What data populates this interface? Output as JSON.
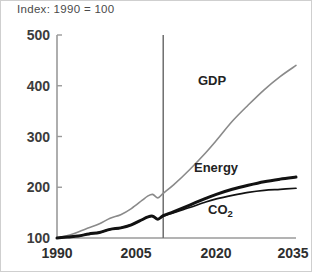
{
  "chart_data": {
    "type": "line",
    "title": "Index: 1990 = 100",
    "xlabel": "",
    "ylabel": "",
    "xlim": [
      1990,
      2035
    ],
    "ylim": [
      100,
      500
    ],
    "grid": false,
    "legend_position": "inline-annotations",
    "xticks": [
      "1990",
      "2005",
      "2020",
      "2035"
    ],
    "xtick_values": [
      1990,
      2005,
      2020,
      2035
    ],
    "yticks": [
      "100",
      "200",
      "300",
      "400",
      "500"
    ],
    "ytick_values": [
      100,
      200,
      300,
      400,
      500
    ],
    "x": [
      1990,
      1992,
      1994,
      1996,
      1998,
      2000,
      2002,
      2004,
      2006,
      2007,
      2008,
      2009,
      2010,
      2012,
      2015,
      2018,
      2020,
      2023,
      2026,
      2029,
      2032,
      2035
    ],
    "series": [
      {
        "name": "GDP",
        "color": "#8a8a8a",
        "width": 1.6,
        "values": [
          100,
          105,
          112,
          120,
          128,
          139,
          146,
          158,
          174,
          182,
          186,
          179,
          188,
          205,
          235,
          268,
          292,
          330,
          362,
          392,
          418,
          440
        ]
      },
      {
        "name": "Energy",
        "color": "#121212",
        "width": 3.0,
        "values": [
          100,
          102,
          104,
          108,
          111,
          117,
          120,
          126,
          136,
          141,
          143,
          137,
          144,
          152,
          165,
          178,
          186,
          196,
          204,
          211,
          216,
          220
        ]
      },
      {
        "name": "CO2",
        "color": "#121212",
        "width": 1.7,
        "values": [
          100,
          102,
          104,
          108,
          111,
          117,
          120,
          126,
          136,
          141,
          143,
          137,
          143,
          150,
          160,
          171,
          177,
          184,
          190,
          194,
          196,
          198
        ]
      }
    ],
    "annotations": [
      {
        "text": "GDP",
        "x": 2022,
        "y": 400
      },
      {
        "text": "Energy",
        "x": 2021,
        "y": 232
      },
      {
        "text": "CO2",
        "x": 2023,
        "y": 152,
        "subscript": "2"
      }
    ],
    "divider": {
      "x": 2010,
      "label": "",
      "color": "#6e6e6e"
    }
  }
}
